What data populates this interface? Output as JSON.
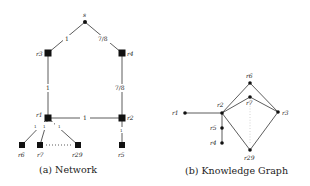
{
  "figure": {
    "network": {
      "caption": "(a) Network",
      "nodes": [
        {
          "id": "s",
          "label": "s",
          "x": 85,
          "y": 22,
          "shape": "dot"
        },
        {
          "id": "r3",
          "label": "r3",
          "x": 48,
          "y": 53,
          "shape": "square"
        },
        {
          "id": "r4",
          "label": "r4",
          "x": 122,
          "y": 53,
          "shape": "square"
        },
        {
          "id": "r1",
          "label": "r1",
          "x": 48,
          "y": 118,
          "shape": "square"
        },
        {
          "id": "r2",
          "label": "r2",
          "x": 122,
          "y": 118,
          "shape": "square"
        },
        {
          "id": "r6",
          "label": "r6",
          "x": 22,
          "y": 145,
          "shape": "square"
        },
        {
          "id": "r7",
          "label": "r7",
          "x": 40,
          "y": 145,
          "shape": "square"
        },
        {
          "id": "r29",
          "label": "r29",
          "x": 78,
          "y": 145,
          "shape": "square"
        },
        {
          "id": "r5",
          "label": "r5",
          "x": 122,
          "y": 145,
          "shape": "square"
        }
      ],
      "edge_labels": {
        "s_r3": "1",
        "s_r4": "7/8",
        "r3_r1": "1",
        "r4_r2": "7/8",
        "r1_r2": "1",
        "r1_r6": "1",
        "r1_r7": "1",
        "r1_r29": "1",
        "r2_r5": "1"
      },
      "ellipsis": "· · · · ·"
    },
    "knowledge_graph": {
      "caption": "(b) Knowledge Graph",
      "nodes": [
        {
          "id": "r1",
          "label": "r1"
        },
        {
          "id": "r2",
          "label": "r2"
        },
        {
          "id": "r6",
          "label": "r6"
        },
        {
          "id": "r7",
          "label": "r7"
        },
        {
          "id": "r3",
          "label": "r3"
        },
        {
          "id": "r29",
          "label": "r29"
        },
        {
          "id": "r5",
          "label": "r5"
        },
        {
          "id": "r4",
          "label": "r4"
        }
      ],
      "edges": [
        [
          "r1",
          "r2"
        ],
        [
          "r2",
          "r6"
        ],
        [
          "r6",
          "r3"
        ],
        [
          "r2",
          "r7"
        ],
        [
          "r7",
          "r3"
        ],
        [
          "r2",
          "r29"
        ],
        [
          "r29",
          "r3"
        ],
        [
          "r2",
          "r5"
        ],
        [
          "r5",
          "r4"
        ]
      ]
    }
  }
}
